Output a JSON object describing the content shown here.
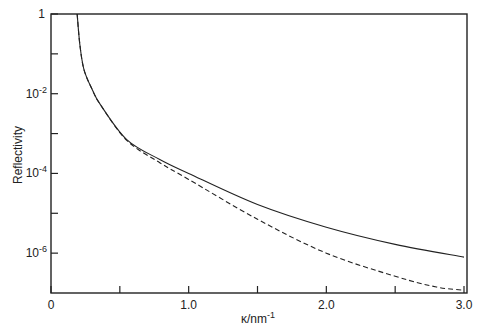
{
  "chart_data": {
    "type": "line",
    "title": "",
    "xlabel": "κ/nm",
    "xlabel_superscript": "-1",
    "ylabel": "Reflectivity",
    "xlim": [
      0,
      3.0
    ],
    "ylim": [
      1e-07,
      1
    ],
    "yscale": "log",
    "grid": false,
    "legend": null,
    "x_ticks": [
      {
        "value": 0,
        "label": "0"
      },
      {
        "value": 0.5,
        "label": ""
      },
      {
        "value": 1.0,
        "label": "1.0"
      },
      {
        "value": 1.5,
        "label": ""
      },
      {
        "value": 2.0,
        "label": "2.0"
      },
      {
        "value": 2.5,
        "label": ""
      },
      {
        "value": 3.0,
        "label": "3.0"
      }
    ],
    "y_ticks": [
      {
        "log10": 0,
        "base": "1",
        "exp": ""
      },
      {
        "log10": -1,
        "base": "",
        "exp": ""
      },
      {
        "log10": -2,
        "base": "10",
        "exp": "-2"
      },
      {
        "log10": -3,
        "base": "",
        "exp": ""
      },
      {
        "log10": -4,
        "base": "10",
        "exp": "-4"
      },
      {
        "log10": -5,
        "base": "",
        "exp": ""
      },
      {
        "log10": -6,
        "base": "10",
        "exp": "-6"
      }
    ],
    "series": [
      {
        "name": "solid",
        "style": "solid",
        "color": "#222222",
        "x": [
          0.19,
          0.21,
          0.24,
          0.3,
          0.36,
          0.55,
          0.79,
          1.0,
          1.5,
          2.0,
          2.5,
          3.0
        ],
        "log10y": [
          0.0,
          -0.78,
          -1.4,
          -1.9,
          -2.28,
          -3.15,
          -3.65,
          -4.0,
          -4.78,
          -5.35,
          -5.78,
          -6.1
        ]
      },
      {
        "name": "dashed",
        "style": "dashed",
        "color": "#222222",
        "x": [
          0.19,
          0.21,
          0.24,
          0.3,
          0.36,
          0.55,
          0.79,
          1.0,
          1.5,
          2.0,
          2.5,
          2.8,
          3.0
        ],
        "log10y": [
          0.0,
          -0.78,
          -1.4,
          -1.9,
          -2.28,
          -3.17,
          -3.73,
          -4.15,
          -5.15,
          -6.0,
          -6.58,
          -6.85,
          -6.93
        ]
      }
    ]
  }
}
